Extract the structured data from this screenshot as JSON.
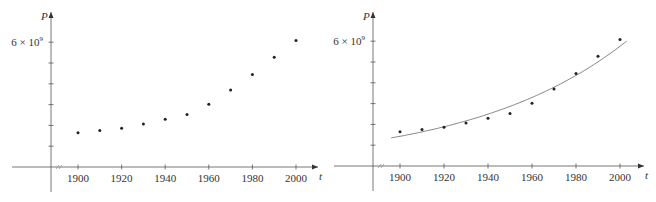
{
  "chart_data": [
    {
      "type": "scatter",
      "title": "",
      "xlabel": "t",
      "ylabel": "P",
      "y_tick_label": "6 × 10⁹",
      "x_ticks": [
        1900,
        1920,
        1940,
        1960,
        1980,
        2000
      ],
      "y_ticks": [
        1000000000.0,
        2000000000.0,
        3000000000.0,
        4000000000.0,
        5000000000.0,
        6000000000.0
      ],
      "xlim": [
        1885,
        2010
      ],
      "ylim": [
        0,
        6600000000.0
      ],
      "axis_break": true,
      "grid": false,
      "series": [
        {
          "name": "population",
          "x": [
            1900,
            1910,
            1920,
            1930,
            1940,
            1950,
            1960,
            1970,
            1980,
            1990,
            2000
          ],
          "values": [
            1650000000.0,
            1750000000.0,
            1860000000.0,
            2070000000.0,
            2300000000.0,
            2520000000.0,
            3020000000.0,
            3700000000.0,
            4450000000.0,
            5280000000.0,
            6080000000.0
          ]
        }
      ]
    },
    {
      "type": "scatter",
      "title": "",
      "xlabel": "t",
      "ylabel": "P",
      "y_tick_label": "6 × 10⁹",
      "x_ticks": [
        1900,
        1920,
        1940,
        1960,
        1980,
        2000
      ],
      "y_ticks": [
        1000000000.0,
        2000000000.0,
        3000000000.0,
        4000000000.0,
        5000000000.0,
        6000000000.0
      ],
      "xlim": [
        1885,
        2010
      ],
      "ylim": [
        0,
        6600000000.0
      ],
      "axis_break": true,
      "grid": false,
      "series": [
        {
          "name": "population",
          "x": [
            1900,
            1910,
            1920,
            1930,
            1940,
            1950,
            1960,
            1970,
            1980,
            1990,
            2000
          ],
          "values": [
            1650000000.0,
            1750000000.0,
            1860000000.0,
            2070000000.0,
            2300000000.0,
            2520000000.0,
            3020000000.0,
            3700000000.0,
            4450000000.0,
            5280000000.0,
            6080000000.0
          ]
        },
        {
          "name": "exponential model",
          "type": "line",
          "x_range": [
            1896,
            2003
          ],
          "model": "P = a·b^t",
          "sample_x": [
            1896,
            1920,
            1940,
            1960,
            1980,
            2003
          ],
          "sample_values": [
            1350000000.0,
            1850000000.0,
            2450000000.0,
            3250000000.0,
            4350000000.0,
            6000000000.0
          ]
        }
      ]
    }
  ],
  "labels": {
    "y_axis": "P",
    "x_axis": "t",
    "y_top": "6 × 10",
    "y_top_exp": "9",
    "x_ticks": [
      "1900",
      "1920",
      "1940",
      "1960",
      "1980",
      "2000"
    ]
  }
}
